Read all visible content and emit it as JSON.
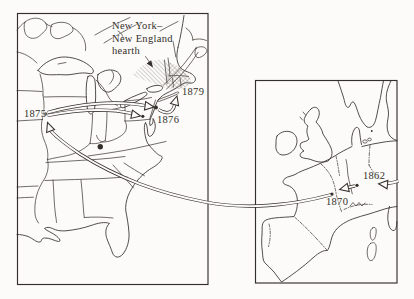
{
  "colors": {
    "ink": "#332f2a",
    "paper": "#fcfbf9",
    "hatch": "#6d6962"
  },
  "us_map": {
    "hearth_label_lines": [
      "New York–",
      "New England",
      "hearth"
    ],
    "dates": {
      "d1875": "1875",
      "d1876": "1876",
      "d1879": "1879"
    }
  },
  "europe_map": {
    "dates": {
      "d1862": "1862",
      "d1870": "1870"
    }
  }
}
